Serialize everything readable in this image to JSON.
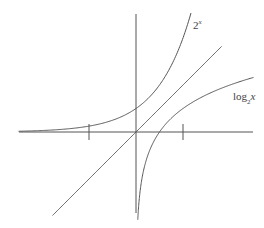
{
  "diagram": {
    "title": "",
    "labels": {
      "exp": {
        "base": "2",
        "sup": "x"
      },
      "log": {
        "pre": "log",
        "sub": "2",
        "post": "x"
      }
    },
    "colors": {
      "line": "#555555",
      "text": "#444444",
      "background": "#ffffff"
    }
  },
  "chart_data": {
    "type": "line",
    "title": "",
    "xlabel": "",
    "ylabel": "",
    "origin_px": [
      136,
      132
    ],
    "unit_px": 23.5,
    "xlim": [
      -5,
      5
    ],
    "ylim": [
      -3.5,
      5.1
    ],
    "x_ticks": [
      -2,
      2
    ],
    "grid": false,
    "series": [
      {
        "name": "2^x",
        "function": "2^x",
        "x_range": [
          -5,
          2.34
        ]
      },
      {
        "name": "y = x",
        "function": "x",
        "x_range": [
          -3.55,
          3.64
        ]
      },
      {
        "name": "log_2 x",
        "function": "log2(x)",
        "x_range": [
          0.075,
          5
        ]
      }
    ],
    "annotations": [
      {
        "text": "2^x",
        "position": "near top of exponential curve"
      },
      {
        "text": "log_2 x",
        "position": "right, below logarithm curve"
      }
    ]
  }
}
